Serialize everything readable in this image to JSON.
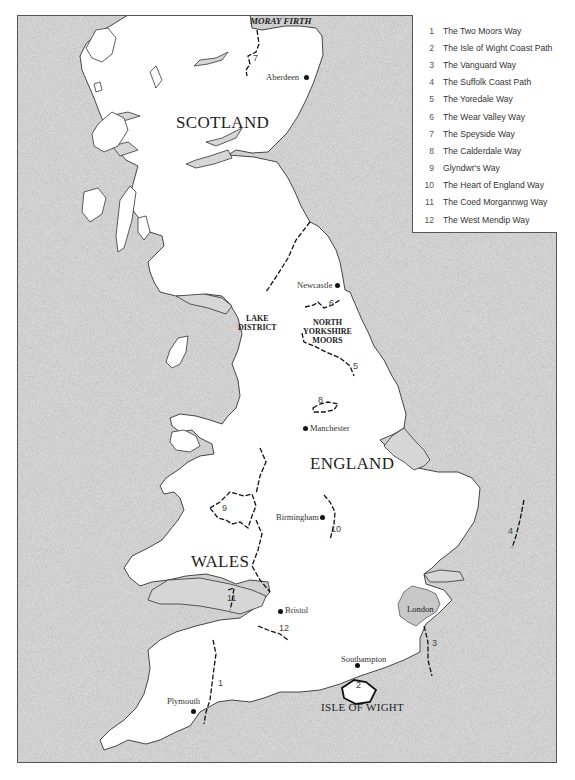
{
  "map": {
    "sea_color": "#d6d6d6",
    "land_color": "#ffffff",
    "coast_color": "#333333",
    "route_color": "#111111",
    "london_fill": "#c8c8c8"
  },
  "legend": {
    "items": [
      {
        "num": "1",
        "label": "The Two Moors Way"
      },
      {
        "num": "2",
        "label": "The Isle of Wight Coast Path"
      },
      {
        "num": "3",
        "label": "The Vanguard Way"
      },
      {
        "num": "4",
        "label": "The Suffolk Coast Path"
      },
      {
        "num": "5",
        "label": "The Yoredale Way"
      },
      {
        "num": "6",
        "label": "The Wear Valley Way"
      },
      {
        "num": "7",
        "label": "The Speyside Way"
      },
      {
        "num": "8",
        "label": "The Calderdale Way"
      },
      {
        "num": "9",
        "label": "Glyndwr's Way"
      },
      {
        "num": "10",
        "label": "The Heart of England Way"
      },
      {
        "num": "11",
        "label": "The Coed Morgannwg Way"
      },
      {
        "num": "12",
        "label": "The West Mendip Way"
      }
    ]
  },
  "labels": {
    "countries": {
      "scotland": "SCOTLAND",
      "england": "ENGLAND",
      "wales": "WALES"
    },
    "regions": {
      "lake_district_1": "LAKE",
      "lake_district_2": "DISTRICT",
      "north_york_1": "NORTH",
      "north_york_2": "YORKSHIRE",
      "north_york_3": "MOORS",
      "isle_of_wight": "ISLE OF WIGHT"
    },
    "water": {
      "moray_firth": "MORAY FIRTH"
    },
    "cities": {
      "aberdeen": "Aberdeen",
      "newcastle": "Newcastle",
      "manchester": "Manchester",
      "birmingham": "Birmingham",
      "bristol": "Bristol",
      "southampton": "Southampton",
      "plymouth": "Plymouth",
      "london": "London"
    },
    "routes": {
      "r1": "1",
      "r2": "2",
      "r3": "3",
      "r4": "4",
      "r5": "5",
      "r6": "6",
      "r7": "7",
      "r8": "8",
      "r9": "9",
      "r10": "10",
      "r11": "11",
      "r12": "12"
    }
  }
}
